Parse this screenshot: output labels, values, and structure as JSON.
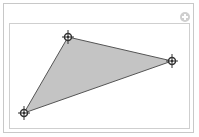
{
  "widget": {
    "type": "polygon-editor",
    "add_button_icon": "plus-circle-icon"
  },
  "polygon": {
    "shape": "triangle",
    "fill_color": "#c4c4c4",
    "stroke_color": "#555555",
    "vertices": [
      {
        "id": "vertex-1",
        "x": 68,
        "y": 37
      },
      {
        "id": "vertex-2",
        "x": 172,
        "y": 61
      },
      {
        "id": "vertex-3",
        "x": 24,
        "y": 113
      }
    ],
    "handle_icon": "crosshair-locator-icon"
  },
  "colors": {
    "frame_border": "#c8c8c8",
    "plot_border": "#cfcfcf",
    "add_icon": "#cfcfcf",
    "handle": "#333333"
  }
}
